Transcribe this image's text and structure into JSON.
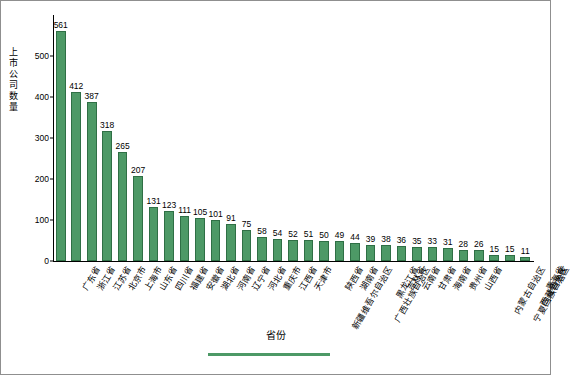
{
  "chart_data": {
    "type": "bar",
    "title": "",
    "xlabel": "省份",
    "ylabel": "上市公司数量",
    "ylim": [
      0,
      600
    ],
    "yticks": [
      0,
      100,
      200,
      300,
      400,
      500
    ],
    "grid": false,
    "legend": "",
    "bar_color": "#4d9966",
    "categories": [
      "广东省",
      "浙江省",
      "江苏省",
      "北京市",
      "上海市",
      "山东省",
      "四川省",
      "福建省",
      "安徽省",
      "湖北省",
      "河南省",
      "辽宁省",
      "河北省",
      "重庆市",
      "江西省",
      "天津市",
      "新疆维吾尔自治区",
      "陕西省",
      "湖南省",
      "广西壮族自治区",
      "黑龙江省",
      "吉林省",
      "云南省",
      "甘肃省",
      "海南省",
      "贵州省",
      "山西省",
      "内蒙古自治区",
      "宁夏回族自治区",
      "西藏自治区",
      "青海省"
    ],
    "values": [
      561,
      412,
      387,
      318,
      265,
      207,
      131,
      123,
      111,
      105,
      101,
      91,
      75,
      58,
      54,
      52,
      51,
      50,
      49,
      44,
      39,
      38,
      36,
      35,
      33,
      31,
      28,
      26,
      15,
      15,
      11
    ]
  }
}
